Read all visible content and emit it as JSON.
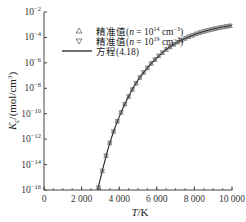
{
  "chart_data": {
    "type": "line",
    "title": "",
    "xlabel": "T/K",
    "ylabel": "Kc/(mol/cm³)",
    "ylabel_parts": {
      "symbol": "K",
      "sub": "c",
      "unit": "/(mol/cm",
      "sup": "3",
      "close": ")"
    },
    "xlabel_parts": {
      "symbol": "T",
      "unit": "/K"
    },
    "xlim": [
      0,
      10000
    ],
    "ylim_log10": [
      -16,
      -2
    ],
    "yscale": "log",
    "grid": false,
    "legend_position": "upper-left-inside",
    "x_ticks": [
      {
        "value": 0,
        "label": "0"
      },
      {
        "value": 2000,
        "label": "2 000"
      },
      {
        "value": 4000,
        "label": "4 000"
      },
      {
        "value": 6000,
        "label": "6 000"
      },
      {
        "value": 8000,
        "label": "8 000"
      },
      {
        "value": 10000,
        "label": "10 000"
      }
    ],
    "x_minor_step": 500,
    "y_ticks": [
      {
        "exp": -2,
        "base": "10",
        "sup": "−2"
      },
      {
        "exp": -4,
        "base": "10",
        "sup": "−4"
      },
      {
        "exp": -6,
        "base": "10",
        "sup": "−6"
      },
      {
        "exp": -8,
        "base": "10",
        "sup": "−8"
      },
      {
        "exp": -10,
        "base": "10",
        "sup": "−10"
      },
      {
        "exp": -12,
        "base": "10",
        "sup": "−12"
      },
      {
        "exp": -14,
        "base": "10",
        "sup": "−14"
      },
      {
        "exp": -16,
        "base": "10",
        "sup": "−16"
      }
    ],
    "series": [
      {
        "name": "精准值(n = 10¹⁴ cm⁻³)",
        "legend_prefix": "精准值(",
        "legend_n": "n",
        "legend_mid": " = 10",
        "legend_exp": "14",
        "legend_unit": " cm",
        "legend_unit_exp": "−3",
        "legend_close": ")",
        "marker": "triangle-up",
        "x": [
          2900,
          3100,
          3300,
          3500,
          3700,
          3900,
          4100,
          4300,
          4500,
          4700,
          4900,
          5100,
          5300,
          5500,
          5700,
          5900,
          6100,
          6300,
          6500,
          6700,
          6900,
          7100,
          7300,
          7500,
          7700,
          7900,
          8100,
          8300,
          8500,
          8700,
          8900,
          9100,
          9300,
          9500,
          9700,
          9900
        ],
        "log10_y": [
          -15.8,
          -14.5,
          -13.3,
          -12.3,
          -11.4,
          -10.6,
          -9.9,
          -9.25,
          -8.65,
          -8.1,
          -7.6,
          -7.15,
          -6.75,
          -6.4,
          -6.05,
          -5.75,
          -5.45,
          -5.2,
          -4.95,
          -4.75,
          -4.55,
          -4.38,
          -4.22,
          -4.08,
          -3.95,
          -3.83,
          -3.72,
          -3.62,
          -3.53,
          -3.45,
          -3.38,
          -3.31,
          -3.25,
          -3.19,
          -3.14,
          -3.09
        ]
      },
      {
        "name": "精准值(n = 10¹⁹ cm⁻³)",
        "legend_prefix": "精准值(",
        "legend_n": "n",
        "legend_mid": " = 10",
        "legend_exp": "19",
        "legend_unit": " cm",
        "legend_unit_exp": "−3",
        "legend_close": ")",
        "marker": "triangle-down",
        "x": [
          2900,
          3100,
          3300,
          3500,
          3700,
          3900,
          4100,
          4300,
          4500,
          4700,
          4900,
          5100,
          5300,
          5500,
          5700,
          5900,
          6100,
          6300,
          6500,
          6700,
          6900,
          7100,
          7300,
          7500,
          7700,
          7900,
          8100,
          8300,
          8500,
          8700,
          8900,
          9100,
          9300,
          9500,
          9700,
          9900
        ],
        "log10_y": [
          -15.8,
          -14.5,
          -13.3,
          -12.3,
          -11.4,
          -10.6,
          -9.9,
          -9.25,
          -8.65,
          -8.1,
          -7.6,
          -7.15,
          -6.75,
          -6.4,
          -6.05,
          -5.75,
          -5.45,
          -5.2,
          -4.95,
          -4.75,
          -4.55,
          -4.38,
          -4.22,
          -4.08,
          -3.95,
          -3.83,
          -3.72,
          -3.62,
          -3.53,
          -3.45,
          -3.38,
          -3.31,
          -3.25,
          -3.19,
          -3.14,
          -3.09
        ]
      },
      {
        "name": "方程(4.18)",
        "marker": "line",
        "x": [
          2850,
          3000,
          3200,
          3400,
          3600,
          3800,
          4000,
          4250,
          4500,
          4750,
          5000,
          5250,
          5500,
          5750,
          6000,
          6250,
          6500,
          6750,
          7000,
          7250,
          7500,
          7750,
          8000,
          8250,
          8500,
          8750,
          9000,
          9250,
          9500,
          9750,
          10000
        ],
        "log10_y": [
          -16.0,
          -15.1,
          -13.9,
          -12.8,
          -11.85,
          -11.0,
          -10.25,
          -9.4,
          -8.65,
          -7.95,
          -7.35,
          -6.85,
          -6.4,
          -5.98,
          -5.6,
          -5.27,
          -4.95,
          -4.7,
          -4.46,
          -4.26,
          -4.08,
          -3.92,
          -3.78,
          -3.65,
          -3.53,
          -3.43,
          -3.34,
          -3.26,
          -3.18,
          -3.12,
          -3.06
        ]
      }
    ]
  }
}
